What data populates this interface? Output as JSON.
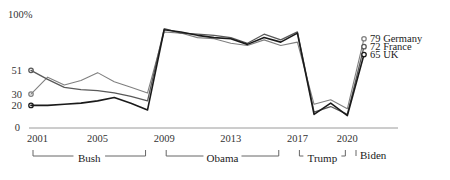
{
  "chart_data": {
    "type": "line",
    "title": "",
    "subtitle": "",
    "xlabel": "",
    "ylabel": "",
    "top_axis_label": "100%",
    "baseline_label": "0",
    "ylim": [
      0,
      100
    ],
    "grid": false,
    "legend_position": "right-endpoint-labels",
    "x": [
      2001,
      2002,
      2003,
      2004,
      2005,
      2006,
      2007,
      2008,
      2009,
      2010,
      2011,
      2012,
      2013,
      2014,
      2015,
      2016,
      2017,
      2018,
      2019,
      2020,
      2021
    ],
    "xticks": [
      "2001",
      "2005",
      "2009",
      "2013",
      "2017",
      "2020"
    ],
    "xtick_values": [
      2001,
      2005,
      2009,
      2013,
      2017,
      2020
    ],
    "ytick_labels": [
      "51",
      "30",
      "20",
      "0"
    ],
    "ytick_values": [
      51,
      30,
      20,
      0
    ],
    "series": [
      {
        "name": "Germany",
        "color": "#808080",
        "width": 1.1,
        "start_value": 30,
        "start_label": "30",
        "end_value": 79,
        "end_label": "79 Germany",
        "values": [
          30,
          45,
          38,
          42,
          49,
          41,
          36,
          31,
          85,
          84,
          80,
          79,
          75,
          73,
          78,
          73,
          76,
          21,
          25,
          17,
          79
        ]
      },
      {
        "name": "France",
        "color": "#595959",
        "width": 1.3,
        "start_value": 51,
        "start_label": "51",
        "end_value": 72,
        "end_label": "72 France",
        "values": [
          51,
          43,
          36,
          34,
          33,
          31,
          28,
          24,
          88,
          84,
          83,
          82,
          80,
          75,
          83,
          78,
          85,
          14,
          19,
          12,
          72
        ]
      },
      {
        "name": "UK",
        "color": "#1a1a1a",
        "width": 1.6,
        "start_value": 20,
        "start_label": "20",
        "end_value": 65,
        "end_label": "65 UK",
        "values": [
          20,
          20,
          21,
          22,
          24,
          27,
          22,
          16,
          87,
          85,
          82,
          80,
          79,
          74,
          80,
          76,
          84,
          12,
          22,
          11,
          65
        ]
      }
    ],
    "eras": [
      {
        "label": "Bush",
        "start": 2001,
        "end": 2008
      },
      {
        "label": "Obama",
        "start": 2009,
        "end": 2016
      },
      {
        "label": "Trump",
        "start": 2017,
        "end": 2020
      },
      {
        "label": "Biden",
        "start": 2021,
        "end": 2021
      }
    ]
  }
}
